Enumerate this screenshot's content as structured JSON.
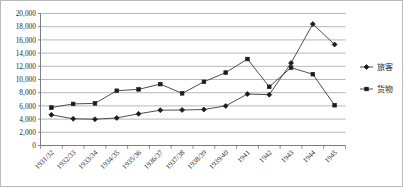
{
  "chart_data": {
    "type": "line",
    "title": "",
    "subtitle": "",
    "xlabel": "",
    "ylabel": "",
    "ylim": [
      0,
      20000
    ],
    "ytick_step": 2000,
    "grid": true,
    "legend_position": "right",
    "categories": [
      "1931/32",
      "1932/33",
      "1933/34",
      "1934/35",
      "1935/36",
      "1936/37",
      "1937/38",
      "1938/39",
      "1939/40",
      "1941",
      "1942",
      "1943",
      "1944",
      "1945"
    ],
    "ytick_labels": [
      "0",
      "2,000",
      "4,000",
      "6,000",
      "8,000",
      "10,000",
      "12,000",
      "14,000",
      "16,000",
      "18,000",
      "20,000"
    ],
    "ytick_values": [
      0,
      2000,
      4000,
      6000,
      8000,
      10000,
      12000,
      14000,
      16000,
      18000,
      20000
    ],
    "series": [
      {
        "name": "旅客",
        "marker": "diamond",
        "color": "#333333",
        "values": [
          4650,
          4050,
          3980,
          4180,
          4800,
          5350,
          5380,
          5450,
          6000,
          7800,
          7700,
          12500,
          18400,
          15300
        ]
      },
      {
        "name": "货物",
        "marker": "square",
        "color": "#1c1c1c",
        "values": [
          5750,
          6300,
          6380,
          8300,
          8500,
          9300,
          7900,
          9650,
          11050,
          13100,
          8900,
          11800,
          10800,
          6100
        ]
      }
    ]
  },
  "legend": {
    "items": [
      {
        "label": "旅客",
        "marker": "diamond"
      },
      {
        "label": "货物",
        "marker": "square"
      }
    ]
  },
  "axes": {
    "x_label_rotation": "-45"
  }
}
